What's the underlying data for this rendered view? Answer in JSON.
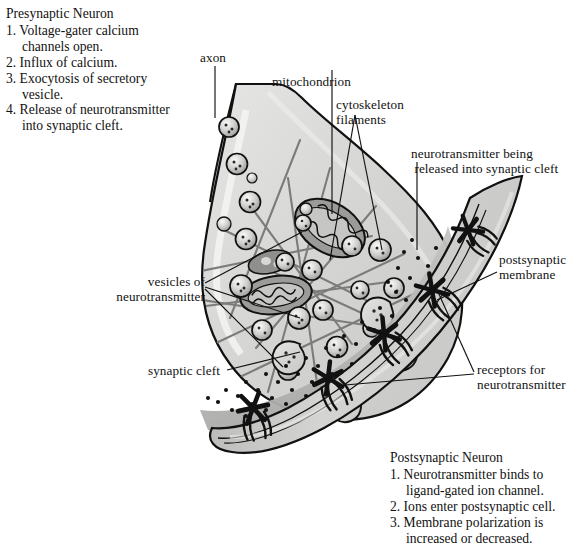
{
  "figure": {
    "kind": "biology-diagram",
    "background_color": "#ffffff",
    "ink_color": "#111111",
    "cell_fill": "#d8d8d6",
    "cell_fill_light": "#e8e8e6",
    "cleft_fill": "#b5b5b3",
    "organelle_fill": "#8f8f8d"
  },
  "presynaptic_block": {
    "title": "Presynaptic Neuron",
    "items": [
      "1. Voltage-gater calcium\n    channels open.",
      "2. Influx of calcium.",
      "3. Exocytosis of secretory\n    vesicle.",
      "4. Release of neurotransmitter\n    into synaptic cleft."
    ]
  },
  "postsynaptic_block": {
    "title": "Postsynaptic Neuron",
    "items": [
      "1. Neurotransmitter binds to\n    ligand-gated ion channel.",
      "2. Ions enter postsynaptic cell.",
      "3. Membrane polarization is\n    increased or decreased."
    ]
  },
  "callouts": {
    "axon": "axon",
    "mitochondrion": "mitochondrion",
    "cytoskeleton": "cytoskeleton\nfilaments",
    "release": "neurotransmitter being\n released into synaptic cleft",
    "postsynaptic_membrane": "postsynaptic\nmembrane",
    "vesicles": "vesicles of\nneurotransmitter",
    "synaptic_cleft": "synaptic cleft",
    "receptors": "receptors for\nneurotransmitter"
  }
}
